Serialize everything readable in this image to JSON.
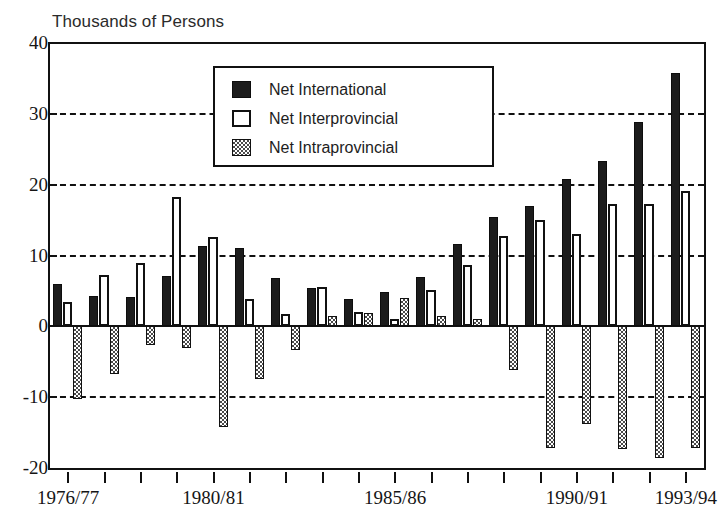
{
  "chart_data": {
    "type": "bar",
    "title": "Thousands of Persons",
    "xlabel": "",
    "ylabel": "Thousands of Persons",
    "ylim": [
      -20,
      40
    ],
    "yticks": [
      40,
      30,
      20,
      10,
      0,
      -10,
      -20
    ],
    "grid": true,
    "grid_style": "dashed horizontal",
    "legend_position": "top-center-inside",
    "categories": [
      "1976/77",
      "1977/78",
      "1978/79",
      "1979/80",
      "1980/81",
      "1981/82",
      "1982/83",
      "1983/84",
      "1984/85",
      "1985/86",
      "1986/87",
      "1987/88",
      "1988/89",
      "1989/90",
      "1990/91",
      "1991/92",
      "1992/93",
      "1993/94"
    ],
    "xtick_labels_shown": [
      "1976/77",
      "1980/81",
      "1985/86",
      "1990/91",
      "1993/94"
    ],
    "series": [
      {
        "name": "Net International",
        "color": "#1c1c1c",
        "values": [
          6.0,
          4.3,
          4.1,
          7.1,
          11.3,
          11.0,
          6.8,
          5.4,
          3.9,
          4.9,
          6.9,
          11.6,
          15.4,
          17.0,
          20.8,
          23.3,
          28.9,
          35.7
        ]
      },
      {
        "name": "Net Interprovincial",
        "color": "#ffffff",
        "values": [
          3.4,
          7.2,
          8.9,
          18.2,
          12.6,
          3.8,
          1.7,
          5.6,
          2.0,
          1.1,
          5.2,
          8.7,
          12.8,
          15.0,
          13.0,
          17.3,
          17.3,
          19.1
        ]
      },
      {
        "name": "Net Intraprovincial",
        "color": "#4a4a4a",
        "values": [
          -10.3,
          -6.8,
          -2.7,
          -3.1,
          -14.2,
          -7.5,
          -3.3,
          1.5,
          1.9,
          4.0,
          1.5,
          1.1,
          -6.1,
          -17.2,
          -13.8,
          -17.3,
          -18.6,
          -17.2
        ]
      }
    ]
  },
  "legend": {
    "items": [
      {
        "label": "Net International",
        "style": "s0"
      },
      {
        "label": "Net Interprovincial",
        "style": "s1"
      },
      {
        "label": "Net Intraprovincial",
        "style": "s2"
      }
    ]
  }
}
